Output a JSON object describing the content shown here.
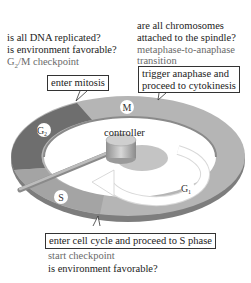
{
  "g2m": {
    "questions": [
      "is all DNA replicated?",
      "is environment favorable?"
    ],
    "checkpoint": "G",
    "checkpoint_sub": "2",
    "checkpoint_rest": "/M checkpoint",
    "action": "enter mitosis"
  },
  "metaphase": {
    "questions": [
      "are all chromosomes",
      "attached to the spindle?"
    ],
    "checkpoint_lines": [
      "metaphase-to-anaphase",
      "transition"
    ],
    "action_lines": [
      "trigger anaphase and",
      "proceed to cytokinesis"
    ]
  },
  "start": {
    "action": "enter cell cycle and proceed to S phase",
    "checkpoint": "start checkpoint",
    "question": "is environment favorable?"
  },
  "cycle": {
    "controller_label": "controller",
    "phases": [
      {
        "name": "M",
        "sub": ""
      },
      {
        "name": "G",
        "sub": "1"
      },
      {
        "name": "S",
        "sub": ""
      },
      {
        "name": "G",
        "sub": "2"
      }
    ]
  },
  "colors": {
    "ring_light": "#b8b8b8",
    "ring_dark": "#6f6f6f",
    "ring_mid": "#9a9a9a",
    "controller": "#c8c8c8"
  }
}
